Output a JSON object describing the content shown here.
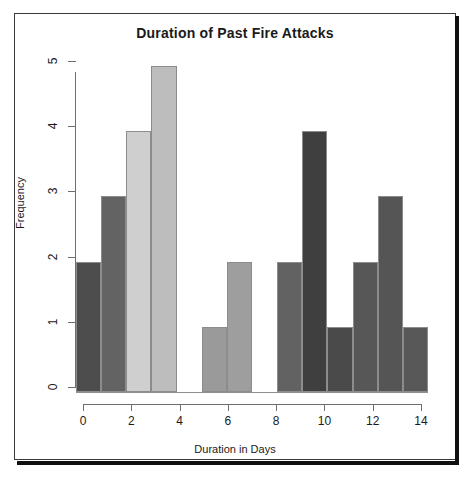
{
  "chart_data": {
    "type": "bar",
    "title": "Duration of Past Fire Attacks",
    "xlabel": "Duration in Days",
    "ylabel": "Frequency",
    "xlim": [
      0,
      14
    ],
    "ylim": [
      0,
      5
    ],
    "grid": false,
    "legend": null,
    "bin_width": 1,
    "bin_edges": [
      0,
      1,
      2,
      3,
      4,
      5,
      6,
      7,
      8,
      9,
      10,
      11,
      12,
      13,
      14
    ],
    "categories": [
      "0-1",
      "1-2",
      "2-3",
      "3-4",
      "4-5",
      "5-6",
      "6-7",
      "7-8",
      "8-9",
      "9-10",
      "10-11",
      "11-12",
      "12-13",
      "13-14"
    ],
    "values": [
      2,
      3,
      4,
      5,
      0,
      1,
      2,
      0,
      2,
      4,
      1,
      2,
      3,
      1
    ],
    "bar_colors": [
      "#4d4d4d",
      "#636363",
      "#cfcfcf",
      "#bdbdbd",
      "#ffffff",
      "#9a9a9a",
      "#9e9e9e",
      "#ffffff",
      "#626262",
      "#3f3f3f",
      "#4a4a4a",
      "#575757",
      "#555555",
      "#585858"
    ],
    "bar_border_color": "#8c8c8c",
    "xticks": [
      0,
      2,
      4,
      6,
      8,
      10,
      12,
      14
    ],
    "xtick_labels": [
      "0",
      "2",
      "4",
      "6",
      "8",
      "10",
      "12",
      "14"
    ],
    "yticks": [
      0,
      1,
      2,
      3,
      4,
      5
    ],
    "ytick_labels": [
      "0",
      "1",
      "2",
      "3",
      "4",
      "5"
    ],
    "axis_color": "#6e6e6e",
    "text_color": "#1a1a1a",
    "background": "#ffffff"
  }
}
